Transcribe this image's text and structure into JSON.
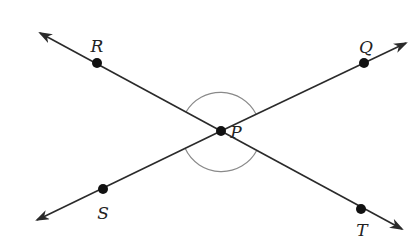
{
  "diagram": {
    "type": "intersecting-lines",
    "colors": {
      "line": "#2a2a2a",
      "arc": "#8a8a8a",
      "point": "#111111",
      "label": "#222222",
      "background": "#ffffff"
    },
    "intersection": {
      "label": "P",
      "x": 221,
      "y": 131
    },
    "points": [
      {
        "label": "R",
        "x": 97,
        "y": 63,
        "lx": 97,
        "ly": 52
      },
      {
        "label": "Q",
        "x": 364,
        "y": 63,
        "lx": 364,
        "ly": 53
      },
      {
        "label": "S",
        "x": 103,
        "y": 189,
        "lx": 103,
        "ly": 218
      },
      {
        "label": "T",
        "x": 361,
        "y": 209,
        "lx": 363,
        "ly": 236
      }
    ],
    "lines": [
      {
        "name": "line-RT",
        "from": [
          40,
          33
        ],
        "to": [
          402,
          229
        ]
      },
      {
        "name": "line-SQ",
        "from": [
          37,
          220
        ],
        "to": [
          406,
          43
        ]
      }
    ],
    "arcs": [
      {
        "name": "angle-RPQ-arc",
        "between": [
          "R",
          "Q"
        ]
      },
      {
        "name": "angle-SPT-arc",
        "between": [
          "S",
          "T"
        ]
      }
    ],
    "labels": {
      "P": "P",
      "R": "R",
      "Q": "Q",
      "S": "S",
      "T": "T"
    }
  }
}
